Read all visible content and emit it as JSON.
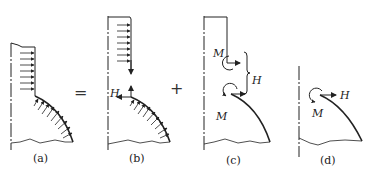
{
  "figure": {
    "panels": [
      {
        "id": "a",
        "caption": "(a)"
      },
      {
        "id": "b",
        "caption": "(b)",
        "force_label": "H"
      },
      {
        "id": "c",
        "caption": "(c)",
        "moment_top": "M",
        "moment_bottom": "M",
        "force_label": "H"
      },
      {
        "id": "d",
        "caption": "(d)",
        "moment_label": "M",
        "force_label": "H"
      }
    ],
    "operators": {
      "equals": "=",
      "plus": "+"
    },
    "colors": {
      "ink": "#222222",
      "background": "#ffffff"
    }
  }
}
